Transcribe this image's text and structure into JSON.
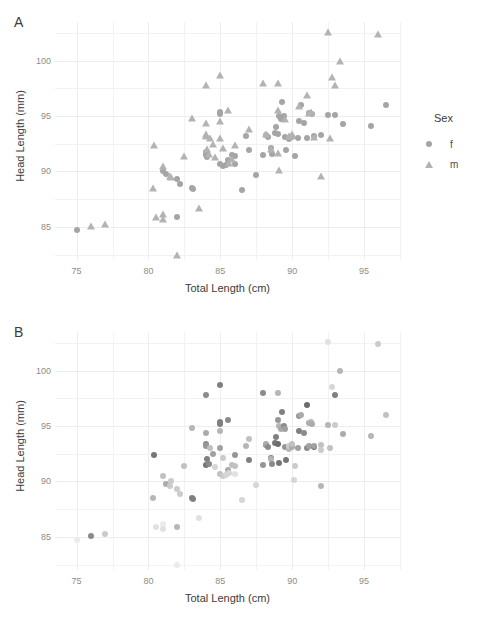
{
  "figure": {
    "panels": [
      {
        "tag": "A",
        "xlabel": "Total Length (cm)",
        "ylabel": "Head Length (mm)",
        "legend_title": "Sex",
        "legend_items": [
          {
            "label": "f",
            "marker": "circle-marker"
          },
          {
            "label": "m",
            "marker": "triangle-marker"
          }
        ]
      },
      {
        "tag": "B",
        "xlabel": "Total Length (cm)",
        "ylabel": "Head Length (mm)",
        "legend_title": "Age",
        "legend_ticks": [
          "7.5",
          "5.0",
          "2.5"
        ]
      }
    ]
  },
  "chart_data": [
    {
      "type": "scatter",
      "panel": "A",
      "title": "",
      "xlabel": "Total Length (cm)",
      "ylabel": "Head Length (mm)",
      "xlim": [
        73.5,
        97.5
      ],
      "ylim": [
        82.0,
        103.5
      ],
      "xticks": [
        75,
        80,
        85,
        90,
        95
      ],
      "yticks": [
        85,
        90,
        95,
        100
      ],
      "grid": true,
      "legend": {
        "title": "Sex",
        "position": "right",
        "entries": [
          "f",
          "m"
        ]
      },
      "series": [
        {
          "name": "f",
          "marker": "circle",
          "color": "#a5a5a5",
          "points": [
            [
              75.0,
              84.7
            ],
            [
              81.0,
              90.0
            ],
            [
              81.2,
              89.8
            ],
            [
              82.0,
              89.3
            ],
            [
              82.2,
              88.9
            ],
            [
              82.0,
              85.9
            ],
            [
              83.0,
              88.5
            ],
            [
              83.1,
              88.4
            ],
            [
              84.0,
              91.5
            ],
            [
              84.0,
              91.8
            ],
            [
              84.1,
              91.3
            ],
            [
              85.0,
              95.4
            ],
            [
              85.0,
              95.2
            ],
            [
              85.0,
              90.7
            ],
            [
              85.2,
              90.5
            ],
            [
              85.4,
              90.6
            ],
            [
              85.5,
              91.0
            ],
            [
              85.8,
              91.5
            ],
            [
              86.0,
              91.4
            ],
            [
              86.0,
              90.7
            ],
            [
              86.5,
              88.3
            ],
            [
              86.8,
              93.2
            ],
            [
              87.0,
              91.9
            ],
            [
              87.5,
              89.7
            ],
            [
              88.0,
              91.5
            ],
            [
              88.2,
              93.3
            ],
            [
              88.3,
              93.1
            ],
            [
              88.5,
              92.1
            ],
            [
              88.6,
              91.6
            ],
            [
              88.8,
              93.5
            ],
            [
              88.9,
              94.0
            ],
            [
              89.0,
              93.4
            ],
            [
              89.1,
              95.0
            ],
            [
              89.2,
              94.7
            ],
            [
              89.3,
              96.3
            ],
            [
              89.4,
              95.0
            ],
            [
              89.5,
              93.1
            ],
            [
              89.6,
              91.9
            ],
            [
              89.8,
              92.9
            ],
            [
              90.0,
              93.1
            ],
            [
              90.2,
              91.4
            ],
            [
              90.4,
              93.0
            ],
            [
              90.5,
              94.6
            ],
            [
              90.6,
              96.0
            ],
            [
              90.8,
              94.4
            ],
            [
              91.0,
              93.0
            ],
            [
              91.2,
              95.3
            ],
            [
              91.4,
              95.2
            ],
            [
              91.5,
              93.2
            ],
            [
              92.0,
              93.3
            ],
            [
              92.5,
              95.1
            ],
            [
              93.0,
              95.1
            ],
            [
              93.5,
              94.3
            ],
            [
              95.5,
              94.1
            ],
            [
              96.5,
              96.0
            ]
          ]
        },
        {
          "name": "m",
          "marker": "triangle",
          "color": "#b3b3b3",
          "points": [
            [
              76.0,
              85.1
            ],
            [
              77.0,
              85.3
            ],
            [
              80.3,
              88.5
            ],
            [
              80.4,
              92.4
            ],
            [
              80.5,
              85.9
            ],
            [
              81.0,
              86.2
            ],
            [
              81.0,
              85.7
            ],
            [
              81.0,
              90.5
            ],
            [
              81.5,
              89.6
            ],
            [
              81.6,
              89.5
            ],
            [
              82.0,
              82.5
            ],
            [
              82.5,
              91.4
            ],
            [
              83.0,
              94.8
            ],
            [
              83.5,
              86.7
            ],
            [
              84.0,
              97.8
            ],
            [
              84.0,
              94.4
            ],
            [
              84.0,
              93.4
            ],
            [
              84.0,
              93.2
            ],
            [
              84.1,
              92.0
            ],
            [
              84.2,
              91.6
            ],
            [
              84.3,
              93.0
            ],
            [
              84.5,
              92.5
            ],
            [
              84.6,
              91.3
            ],
            [
              85.0,
              98.7
            ],
            [
              85.0,
              94.6
            ],
            [
              85.0,
              93.0
            ],
            [
              85.2,
              92.1
            ],
            [
              85.5,
              95.6
            ],
            [
              85.6,
              90.8
            ],
            [
              85.8,
              91.1
            ],
            [
              86.0,
              92.4
            ],
            [
              87.0,
              93.8
            ],
            [
              88.0,
              98.0
            ],
            [
              88.2,
              93.4
            ],
            [
              88.5,
              92.0
            ],
            [
              89.0,
              98.0
            ],
            [
              89.0,
              95.6
            ],
            [
              89.0,
              91.7
            ],
            [
              89.1,
              90.1
            ],
            [
              89.5,
              94.7
            ],
            [
              89.8,
              93.2
            ],
            [
              90.0,
              93.4
            ],
            [
              90.5,
              95.9
            ],
            [
              91.0,
              96.9
            ],
            [
              91.2,
              95.3
            ],
            [
              91.3,
              95.4
            ],
            [
              91.5,
              93.1
            ],
            [
              92.0,
              89.6
            ],
            [
              92.5,
              102.6
            ],
            [
              92.6,
              93.0
            ],
            [
              92.8,
              98.5
            ],
            [
              93.0,
              97.8
            ],
            [
              93.3,
              100.0
            ],
            [
              96.0,
              102.4
            ]
          ]
        }
      ]
    },
    {
      "type": "scatter",
      "panel": "B",
      "title": "",
      "xlabel": "Total Length (cm)",
      "ylabel": "Head Length (mm)",
      "xlim": [
        73.5,
        97.5
      ],
      "ylim": [
        82.0,
        103.5
      ],
      "xticks": [
        75,
        80,
        85,
        90,
        95
      ],
      "yticks": [
        85,
        90,
        95,
        100
      ],
      "grid": true,
      "colorbar": {
        "title": "Age",
        "ticks": [
          7.5,
          5.0,
          2.5
        ],
        "range": [
          1.0,
          9.0
        ],
        "low_color": "#f6f6f6",
        "high_color": "#4b4b4b",
        "position": "right"
      },
      "points": [
        [
          75.0,
          84.7,
          1.5
        ],
        [
          76.0,
          85.1,
          6.0
        ],
        [
          77.0,
          85.3,
          3.0
        ],
        [
          80.3,
          88.5,
          4.0
        ],
        [
          80.4,
          92.4,
          7.0
        ],
        [
          80.5,
          85.9,
          2.0
        ],
        [
          81.0,
          86.2,
          1.5
        ],
        [
          81.0,
          85.7,
          2.0
        ],
        [
          81.0,
          90.5,
          3.5
        ],
        [
          81.2,
          89.8,
          4.5
        ],
        [
          81.5,
          89.6,
          3.0
        ],
        [
          81.6,
          90.0,
          3.0
        ],
        [
          82.0,
          82.5,
          1.5
        ],
        [
          82.0,
          89.3,
          3.0
        ],
        [
          82.2,
          88.9,
          3.0
        ],
        [
          82.0,
          85.9,
          4.0
        ],
        [
          82.5,
          91.4,
          3.5
        ],
        [
          83.0,
          88.5,
          6.5
        ],
        [
          83.1,
          88.4,
          6.5
        ],
        [
          83.0,
          94.8,
          4.0
        ],
        [
          83.5,
          86.7,
          2.0
        ],
        [
          84.0,
          97.8,
          6.0
        ],
        [
          84.0,
          94.4,
          4.5
        ],
        [
          84.0,
          93.4,
          6.0
        ],
        [
          84.0,
          93.2,
          5.5
        ],
        [
          84.0,
          91.5,
          7.0
        ],
        [
          84.1,
          92.0,
          6.5
        ],
        [
          84.2,
          91.6,
          6.0
        ],
        [
          84.3,
          93.0,
          3.5
        ],
        [
          84.5,
          92.5,
          5.0
        ],
        [
          84.6,
          91.3,
          2.5
        ],
        [
          85.0,
          98.7,
          6.5
        ],
        [
          85.0,
          95.4,
          6.5
        ],
        [
          85.0,
          95.2,
          6.5
        ],
        [
          85.0,
          94.6,
          4.0
        ],
        [
          85.0,
          93.0,
          5.0
        ],
        [
          85.0,
          90.7,
          3.5
        ],
        [
          85.2,
          90.5,
          3.0
        ],
        [
          85.2,
          92.1,
          3.0
        ],
        [
          85.4,
          90.6,
          2.5
        ],
        [
          85.5,
          95.6,
          6.0
        ],
        [
          85.5,
          91.0,
          4.5
        ],
        [
          85.6,
          90.8,
          2.5
        ],
        [
          85.8,
          91.5,
          3.5
        ],
        [
          86.0,
          92.4,
          5.5
        ],
        [
          86.0,
          91.4,
          3.5
        ],
        [
          86.0,
          90.7,
          2.0
        ],
        [
          86.5,
          88.3,
          2.5
        ],
        [
          86.8,
          93.2,
          4.0
        ],
        [
          87.0,
          93.8,
          3.5
        ],
        [
          87.0,
          91.9,
          6.5
        ],
        [
          87.5,
          89.7,
          2.5
        ],
        [
          88.0,
          98.0,
          6.0
        ],
        [
          88.0,
          91.5,
          5.5
        ],
        [
          88.2,
          93.3,
          6.5
        ],
        [
          88.2,
          93.4,
          4.5
        ],
        [
          88.3,
          93.1,
          6.0
        ],
        [
          88.5,
          92.1,
          6.5
        ],
        [
          88.5,
          92.0,
          4.0
        ],
        [
          88.6,
          91.6,
          6.0
        ],
        [
          88.8,
          93.5,
          7.0
        ],
        [
          88.9,
          94.0,
          6.5
        ],
        [
          89.0,
          98.0,
          4.0
        ],
        [
          89.0,
          95.6,
          5.5
        ],
        [
          89.0,
          93.4,
          7.5
        ],
        [
          89.1,
          95.0,
          4.0
        ],
        [
          89.1,
          91.7,
          7.0
        ],
        [
          89.2,
          94.7,
          4.5
        ],
        [
          89.3,
          96.3,
          6.5
        ],
        [
          89.4,
          95.0,
          6.0
        ],
        [
          89.5,
          94.7,
          5.0
        ],
        [
          89.5,
          93.1,
          5.5
        ],
        [
          89.6,
          91.9,
          7.0
        ],
        [
          89.8,
          92.9,
          4.0
        ],
        [
          89.8,
          93.2,
          3.0
        ],
        [
          90.0,
          93.1,
          4.5
        ],
        [
          90.0,
          93.4,
          3.5
        ],
        [
          90.1,
          90.1,
          2.5
        ],
        [
          90.2,
          91.4,
          3.0
        ],
        [
          90.4,
          93.0,
          5.0
        ],
        [
          90.5,
          95.9,
          5.5
        ],
        [
          90.5,
          94.6,
          6.5
        ],
        [
          90.6,
          96.0,
          4.5
        ],
        [
          90.8,
          94.4,
          6.0
        ],
        [
          91.0,
          96.9,
          7.5
        ],
        [
          91.0,
          93.0,
          6.0
        ],
        [
          91.2,
          95.3,
          4.5
        ],
        [
          91.2,
          93.2,
          5.0
        ],
        [
          91.3,
          95.4,
          4.0
        ],
        [
          91.4,
          95.2,
          4.5
        ],
        [
          91.5,
          93.1,
          7.5
        ],
        [
          91.5,
          93.2,
          5.0
        ],
        [
          92.0,
          89.6,
          4.0
        ],
        [
          92.0,
          93.3,
          3.5
        ],
        [
          92.0,
          92.8,
          3.0
        ],
        [
          92.5,
          102.6,
          2.0
        ],
        [
          92.5,
          95.1,
          4.0
        ],
        [
          92.6,
          93.0,
          3.5
        ],
        [
          92.8,
          98.5,
          2.5
        ],
        [
          93.0,
          97.8,
          6.5
        ],
        [
          93.0,
          95.1,
          3.0
        ],
        [
          93.3,
          100.0,
          4.0
        ],
        [
          93.5,
          94.3,
          4.5
        ],
        [
          95.5,
          94.1,
          4.0
        ],
        [
          96.0,
          102.4,
          3.0
        ],
        [
          96.5,
          96.0,
          3.5
        ]
      ]
    }
  ]
}
